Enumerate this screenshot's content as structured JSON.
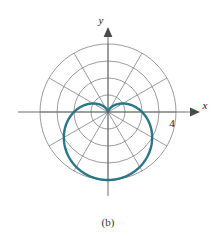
{
  "figure": {
    "caption": "(b)",
    "background_color": "#ffffff",
    "curve_color": "#2a7686",
    "grid_color": "#6e6e6e",
    "axis_color": "#6e6e6e",
    "text_color": "#1a1a1a"
  },
  "axes": {
    "x_label": "x",
    "y_label": "y",
    "x_tick_label": "4",
    "x_tick_value": 4,
    "origin_px": [
      108,
      112
    ],
    "unit_px": 17
  },
  "chart_data": {
    "type": "line",
    "plot_system": "polar",
    "title": "",
    "subtitle": "",
    "xlabel": "x",
    "ylabel": "y",
    "equation": "r = 2(1 - sin θ)",
    "curve_name": "cardioid",
    "orientation": "cusp at origin pointing up, lobe opening downward",
    "theta_range_deg": [
      0,
      360
    ],
    "r_max": 4,
    "grid": true,
    "grid_circles_r": [
      1,
      2,
      3,
      4
    ],
    "grid_radial_spokes_deg": [
      0,
      30,
      60,
      90,
      120,
      150,
      180,
      210,
      240,
      270,
      300,
      330
    ],
    "legend": "none",
    "annotations": [
      {
        "text": "4",
        "position": "x-axis outermost circle",
        "value": 4
      },
      {
        "text": "x",
        "position": "end of positive x-axis"
      },
      {
        "text": "y",
        "position": "end of positive y-axis"
      },
      {
        "text": "(b)",
        "position": "below figure"
      }
    ],
    "theta_deg": [
      0,
      15,
      30,
      45,
      60,
      75,
      90,
      105,
      120,
      135,
      150,
      165,
      180,
      195,
      210,
      225,
      240,
      255,
      270,
      285,
      300,
      315,
      330,
      345,
      360
    ],
    "r": [
      2.0,
      1.48,
      1.0,
      0.59,
      0.27,
      0.07,
      0.0,
      0.07,
      0.27,
      0.59,
      1.0,
      1.48,
      2.0,
      2.52,
      3.0,
      3.41,
      3.73,
      3.93,
      4.0,
      3.93,
      3.73,
      3.41,
      3.0,
      2.52,
      2.0
    ],
    "x": [
      2.0,
      1.43,
      0.87,
      0.41,
      0.13,
      0.02,
      0.0,
      -0.02,
      -0.13,
      -0.41,
      -0.87,
      -1.43,
      -2.0,
      -2.43,
      -2.6,
      -2.41,
      -1.87,
      -1.02,
      0.0,
      1.02,
      1.87,
      2.41,
      2.6,
      2.43,
      2.0
    ],
    "y": [
      0.0,
      0.38,
      0.5,
      0.41,
      0.23,
      0.07,
      0.0,
      0.07,
      0.23,
      0.41,
      0.5,
      0.38,
      0.0,
      -0.65,
      -1.5,
      -2.41,
      -3.23,
      -3.79,
      -4.0,
      -3.79,
      -3.23,
      -2.41,
      -1.5,
      -0.65,
      0.0
    ]
  }
}
